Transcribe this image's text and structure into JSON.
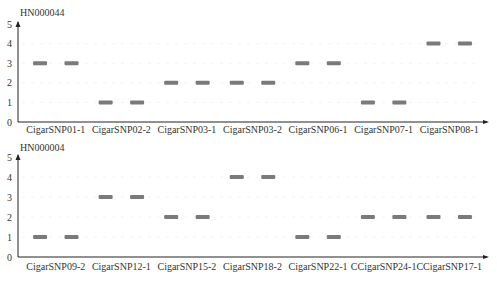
{
  "chart_data": [
    {
      "type": "scatter",
      "title": "HN000044",
      "xlabel": "",
      "ylabel": "",
      "ylim": [
        0,
        5
      ],
      "yticks": [
        0,
        1,
        2,
        3,
        4,
        5
      ],
      "grid": false,
      "categories": [
        "CigarSNP01-1",
        "CigarSNP02-2",
        "CigarSNP03-1",
        "CigarSNP03-2",
        "CigarSNP06-1",
        "CigarSNP07-1",
        "CigarSNP08-1"
      ],
      "values": [
        [
          3,
          3
        ],
        [
          1,
          1
        ],
        [
          2,
          2
        ],
        [
          2,
          2
        ],
        [
          3,
          3
        ],
        [
          1,
          1
        ],
        [
          4,
          4
        ]
      ],
      "marker": "horizontal-bar",
      "marker_color": "#7a7a7a"
    },
    {
      "type": "scatter",
      "title": "HN000004",
      "xlabel": "",
      "ylabel": "",
      "ylim": [
        0,
        5
      ],
      "yticks": [
        0,
        1,
        2,
        3,
        4,
        5
      ],
      "grid": false,
      "categories": [
        "CigarSNP09-2",
        "CigarSNP12-1",
        "CigarSNP15-2",
        "CigarSNP18-2",
        "CigarSNP22-1",
        "CCigarSNP24-1",
        "CCigarSNP17-1"
      ],
      "values": [
        [
          1,
          1
        ],
        [
          3,
          3
        ],
        [
          2,
          2
        ],
        [
          4,
          4
        ],
        [
          1,
          1
        ],
        [
          2,
          2
        ],
        [
          2,
          2
        ]
      ],
      "marker": "horizontal-bar",
      "marker_color": "#7a7a7a"
    }
  ]
}
